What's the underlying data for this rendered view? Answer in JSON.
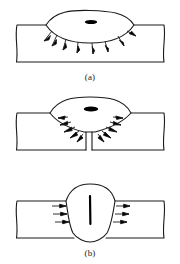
{
  "figure": {
    "background_color": "#ffffff",
    "line_color": "#1a1a1a",
    "fill_color": "#ffffff",
    "mark_color": "#000000",
    "width": 180,
    "height": 264
  },
  "panels": [
    {
      "id": "a",
      "caption": "(a)",
      "description": "Lens-shaped weld pool on plate surface with arrows radiating outward and downward",
      "plate": {
        "left": 16,
        "right": 164,
        "top": 25,
        "bottom": 62
      },
      "pool": {
        "shape": "lens",
        "center_x": 90,
        "top_y": 11,
        "bottom_y": 42,
        "half_width": 44
      },
      "inner_mark": {
        "shape": "ellipse",
        "center_x": 91,
        "center_y": 22,
        "rx": 6,
        "ry": 2
      },
      "arrow_count": 8,
      "arrow_direction": "radial-outward"
    },
    {
      "id": "b",
      "caption": "(b)",
      "description": "Funnel-shaped cavity narrowing to a thin parallel-walled channel reaching the plate underside",
      "plate": {
        "left": 16,
        "right": 164,
        "top": 25,
        "bottom": 62
      },
      "pool": {
        "shape": "funnel",
        "center_x": 90,
        "top_y": 9,
        "neck_y": 44,
        "half_width": 41
      },
      "inner_mark": {
        "shape": "ellipse",
        "center_x": 91,
        "center_y": 21,
        "rx": 7,
        "ry": 2.5
      },
      "channel": {
        "left_x": 86,
        "right_x": 92,
        "top_y": 44,
        "bottom_y": 62
      },
      "arrow_count": 10,
      "arrow_direction": "lateral-outward"
    },
    {
      "id": "c",
      "caption": "(c)",
      "description": "U-shaped bulb cavity penetrating the plate with a vertical keyhole mark and inward lateral arrows",
      "plate": {
        "left": 16,
        "right": 164,
        "top": 25,
        "bottom": 62
      },
      "pool": {
        "shape": "u-bulb",
        "center_x": 90,
        "top_y": 8,
        "bottom_y": 62,
        "half_width": 26
      },
      "inner_mark": {
        "shape": "vertical-line",
        "center_x": 90,
        "top_y": 20,
        "bottom_y": 48
      },
      "arrow_count": 6,
      "arrow_direction": "lateral-right"
    }
  ]
}
